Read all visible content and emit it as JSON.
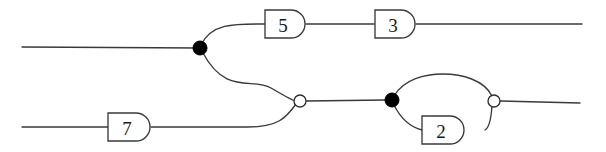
{
  "diagram": {
    "stroke_color": "#3a3a3a",
    "label_color": "#1a1a1a",
    "background_color": "#ffffff",
    "filled_node_color": "#000000",
    "open_node_fill": "#ffffff",
    "boxes": [
      {
        "id": "box-5",
        "label": "5",
        "x": 285,
        "y": 24,
        "width": 40,
        "height": 28
      },
      {
        "id": "box-3",
        "label": "3",
        "x": 395,
        "y": 24,
        "width": 40,
        "height": 28
      },
      {
        "id": "box-7",
        "label": "7",
        "x": 129,
        "y": 127,
        "width": 42,
        "height": 28
      },
      {
        "id": "box-2",
        "label": "2",
        "x": 443,
        "y": 130,
        "width": 42,
        "height": 28
      }
    ],
    "nodes": [
      {
        "id": "node-a",
        "type": "filled",
        "x": 200,
        "y": 48,
        "radius": 7
      },
      {
        "id": "node-b",
        "type": "open",
        "x": 300,
        "y": 101,
        "radius": 6
      },
      {
        "id": "node-c",
        "type": "filled",
        "x": 392,
        "y": 100,
        "radius": 7
      },
      {
        "id": "node-d",
        "type": "open",
        "x": 494,
        "y": 101,
        "radius": 6
      }
    ],
    "strands": [
      {
        "id": "strand-input-top",
        "d": "M 22 47 L 200 48"
      },
      {
        "id": "strand-a-to-5",
        "d": "M 201 45 C 212 22 238 24 265 24"
      },
      {
        "id": "strand-5-to-3",
        "d": "M 306 24 L 374 24"
      },
      {
        "id": "strand-3-output",
        "d": "M 416 24 L 582 24"
      },
      {
        "id": "strand-a-to-b",
        "d": "M 203 53 C 226 96 253 77 271 88 C 283 95 290 99 295 101"
      },
      {
        "id": "strand-input-bottom",
        "d": "M 22 127 L 108 127"
      },
      {
        "id": "strand-7-to-b",
        "d": "M 151 127 L 248 127 C 278 127 286 118 296 104"
      },
      {
        "id": "strand-b-to-c",
        "d": "M 306 101 L 386 100"
      },
      {
        "id": "strand-loop-top",
        "d": "M 394 96 C 404 79 425 74 443 74 C 462 74 484 80 492 96"
      },
      {
        "id": "strand-loop-bottom-left",
        "d": "M 394 105 C 400 117 410 127 422 130"
      },
      {
        "id": "strand-loop-bottom-right",
        "d": "M 485 130 C 489 128 491 120 492 106"
      },
      {
        "id": "strand-d-output",
        "d": "M 500 101 L 580 103"
      }
    ]
  }
}
